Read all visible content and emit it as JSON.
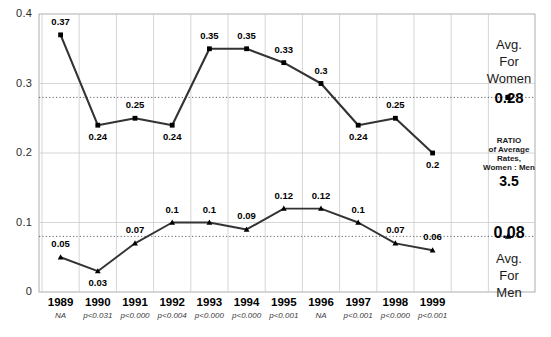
{
  "chart_data": {
    "type": "line",
    "title": "",
    "xlabel": "",
    "ylabel": "",
    "ylim": [
      0,
      0.4
    ],
    "yticks": [
      "0",
      "0.1",
      "0.2",
      "0.3",
      "0.4"
    ],
    "ytick_values": [
      0,
      0.1,
      0.2,
      0.3,
      0.4
    ],
    "grid": true,
    "legend_position": "right-panel",
    "categories": [
      "1989",
      "1990",
      "1991",
      "1992",
      "1993",
      "1994",
      "1995",
      "1996",
      "1997",
      "1998",
      "1999"
    ],
    "series": [
      {
        "name": "Women",
        "marker": "square",
        "values": [
          0.37,
          0.24,
          0.25,
          0.24,
          0.35,
          0.35,
          0.33,
          0.3,
          0.24,
          0.25,
          0.2
        ],
        "labels": [
          "0.37",
          "0.24",
          "0.25",
          "0.24",
          "0.35",
          "0.35",
          "0.33",
          "0.3",
          "0.24",
          "0.25",
          "0.2"
        ],
        "label_positions": [
          "above",
          "below",
          "above",
          "below",
          "above",
          "above",
          "above",
          "above",
          "below",
          "above",
          "below"
        ]
      },
      {
        "name": "Men",
        "marker": "triangle",
        "values": [
          0.05,
          0.03,
          0.07,
          0.1,
          0.1,
          0.09,
          0.12,
          0.12,
          0.1,
          0.07,
          0.06
        ],
        "labels": [
          "0.05",
          "0.03",
          "0.07",
          "0.1",
          "0.1",
          "0.09",
          "0.12",
          "0.12",
          "0.1",
          "0.07",
          "0.06"
        ],
        "label_positions": [
          "above",
          "below",
          "above",
          "above",
          "above",
          "above",
          "above",
          "above",
          "above",
          "above",
          "above"
        ]
      }
    ],
    "reference_lines": [
      {
        "name": "avg-women",
        "value": 0.28,
        "style": "dotted"
      },
      {
        "name": "avg-men",
        "value": 0.08,
        "style": "dotted"
      }
    ],
    "pvalues": [
      "NA",
      "p<0.031",
      "p<0.000",
      "p<0.004",
      "p<0.000",
      "p<0.000",
      "p<0.001",
      "NA",
      "p<0.001",
      "p<0.000",
      "p<0.001"
    ],
    "annotations": {
      "avg_women": {
        "line1": "Avg.",
        "line2": "For",
        "line3": "Women",
        "value": "0.28"
      },
      "ratio": {
        "line1": "RATIO",
        "line2": "of Average",
        "line3": "Rates,",
        "line4": "Women : Men",
        "value": "3.5"
      },
      "avg_men": {
        "value": "0.08",
        "line1": "Avg.",
        "line2": "For",
        "line3": "Men"
      }
    },
    "colors": {
      "line": "#333333",
      "marker": "#000000",
      "grid": "#cccccc",
      "reference": "#555555",
      "axis": "#9a9a9a"
    }
  }
}
